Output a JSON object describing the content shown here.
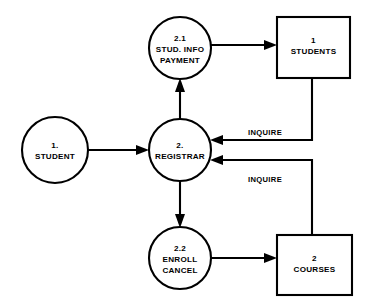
{
  "diagram": {
    "type": "data-flow-diagram",
    "processes": [
      {
        "id": "student",
        "number": "1.",
        "name": "STUDENT",
        "shape": "circle",
        "cx": 55,
        "cy": 150,
        "r": 33
      },
      {
        "id": "stud-info-payment",
        "number": "2.1",
        "name_line1": "STUD. INFO",
        "name_line2": "PAYMENT",
        "shape": "circle",
        "cx": 180,
        "cy": 48,
        "r": 31
      },
      {
        "id": "registrar",
        "number": "2.",
        "name": "REGISTRAR",
        "shape": "circle",
        "cx": 180,
        "cy": 150,
        "r": 31
      },
      {
        "id": "enroll-cancel",
        "number": "2.2",
        "name_line1": "ENROLL",
        "name_line2": "CANCEL",
        "shape": "circle",
        "cx": 180,
        "cy": 258,
        "r": 31
      }
    ],
    "datastores": [
      {
        "id": "students",
        "number": "1",
        "name": "STUDENTS",
        "shape": "rectangle",
        "x": 277,
        "y": 17,
        "width": 73,
        "height": 61
      },
      {
        "id": "courses",
        "number": "2",
        "name": "COURSES",
        "shape": "rectangle",
        "x": 277,
        "y": 235,
        "width": 75,
        "height": 60
      }
    ],
    "flows": [
      {
        "id": "student-to-registrar",
        "from": "student",
        "to": "registrar",
        "label": ""
      },
      {
        "id": "registrar-to-stud-info",
        "from": "registrar",
        "to": "stud-info-payment",
        "label": ""
      },
      {
        "id": "stud-info-to-students",
        "from": "stud-info-payment",
        "to": "students",
        "label": ""
      },
      {
        "id": "students-to-registrar",
        "from": "students",
        "to": "registrar",
        "label": "INQUIRE"
      },
      {
        "id": "registrar-to-enroll",
        "from": "registrar",
        "to": "enroll-cancel",
        "label": ""
      },
      {
        "id": "enroll-to-courses",
        "from": "enroll-cancel",
        "to": "courses",
        "label": ""
      },
      {
        "id": "courses-to-registrar",
        "from": "courses",
        "to": "registrar",
        "label": "INQUIRE"
      }
    ],
    "colors": {
      "stroke": "#000000",
      "fill": "#ffffff",
      "background": "#ffffff"
    }
  }
}
